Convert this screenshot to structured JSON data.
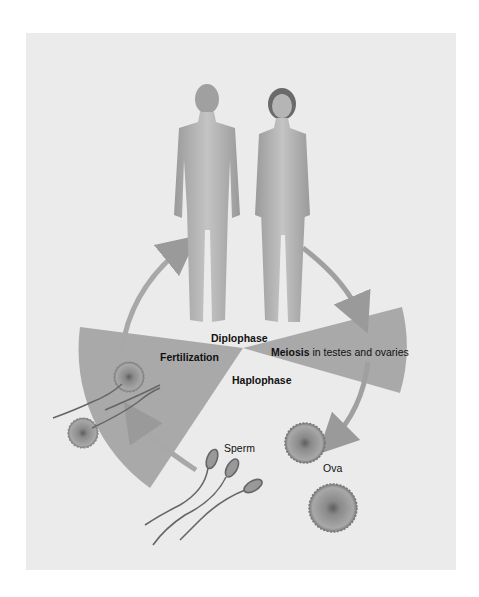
{
  "diagram": {
    "phases": {
      "diplophase": "Diplophase",
      "haplophase": "Haplophase"
    },
    "processes": {
      "fertilization": "Fertilization",
      "meiosis": "Meiosis",
      "meiosis_detail": "in testes and ovaries"
    },
    "cells": {
      "sperm": "Sperm",
      "ova": "Ova"
    },
    "figures": [
      "adult male",
      "adult female"
    ],
    "colors": {
      "background": "#ebebeb",
      "wedge": "#a9a9a9",
      "arrow": "#9a9a9a",
      "cell": "#8f8f8f"
    }
  }
}
